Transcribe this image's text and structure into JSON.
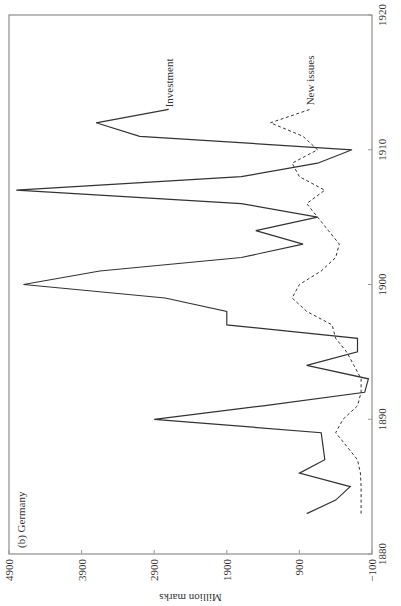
{
  "chart_data": {
    "type": "line",
    "title": "(b) Germany",
    "xlabel": "",
    "ylabel": "Million marks",
    "orientation": "rotated 90° clockwise (years run bottom→top on right edge, values run right→left on bottom edge)",
    "x_ticks": [
      "1880",
      "1890",
      "1900",
      "1910",
      "1920"
    ],
    "y_ticks": [
      "-100",
      "900",
      "1900",
      "2900",
      "3900",
      "4900"
    ],
    "xlim": [
      1880,
      1920
    ],
    "ylim": [
      -100,
      4900
    ],
    "grid": false,
    "series": [
      {
        "name": "Investment",
        "style": "solid",
        "x": [
          1883,
          1884,
          1885,
          1886,
          1887,
          1888,
          1889,
          1890,
          1891,
          1892,
          1893,
          1894,
          1895,
          1896,
          1897,
          1898,
          1899,
          1900,
          1901,
          1902,
          1903,
          1904,
          1905,
          1906,
          1907,
          1908,
          1909,
          1910,
          1911,
          1912,
          1913
        ],
        "values": [
          800,
          400,
          200,
          900,
          550,
          575,
          600,
          2900,
          1400,
          0,
          -50,
          800,
          100,
          100,
          1900,
          1900,
          2750,
          4700,
          3650,
          1700,
          850,
          1500,
          650,
          1700,
          4800,
          1700,
          650,
          175,
          3100,
          3700,
          2700
        ]
      },
      {
        "name": "New issues",
        "style": "dashed",
        "x": [
          1883,
          1884,
          1885,
          1886,
          1887,
          1888,
          1889,
          1890,
          1891,
          1892,
          1893,
          1894,
          1895,
          1896,
          1897,
          1898,
          1899,
          1900,
          1901,
          1902,
          1903,
          1904,
          1905,
          1906,
          1907,
          1908,
          1909,
          1910,
          1911,
          1912,
          1913
        ],
        "values": [
          50,
          50,
          50,
          60,
          100,
          250,
          400,
          300,
          100,
          50,
          50,
          150,
          250,
          400,
          450,
          800,
          1000,
          900,
          600,
          400,
          350,
          500,
          650,
          800,
          550,
          900,
          1000,
          650,
          850,
          1300,
          750
        ]
      }
    ],
    "annotations": [
      {
        "text": "Investment",
        "x": 1913,
        "series": "Investment"
      },
      {
        "text": "New issues",
        "x": 1913,
        "series": "New issues"
      }
    ]
  },
  "labels": {
    "panel": "(b) Germany",
    "ylabel": "Million marks",
    "investment": "Investment",
    "new_issues": "New issues"
  }
}
